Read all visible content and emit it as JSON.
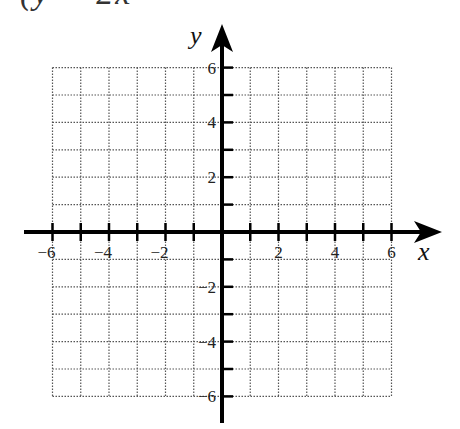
{
  "header": {
    "cropped_text": "(y = 2x"
  },
  "graph": {
    "x_axis_label": "x",
    "y_axis_label": "y",
    "x_range": [
      -6,
      6
    ],
    "y_range": [
      -6,
      6
    ],
    "grid_step": 1,
    "label_step": 2,
    "x_tick_labels": [
      "−6",
      "−4",
      "−2",
      "2",
      "4",
      "6"
    ],
    "y_tick_labels": [
      "6",
      "4",
      "2",
      "−2",
      "−4",
      "−6"
    ],
    "grid_style": "dotted",
    "colors": {
      "axis": "#000000",
      "grid": "#555555",
      "label": "#222222"
    }
  }
}
